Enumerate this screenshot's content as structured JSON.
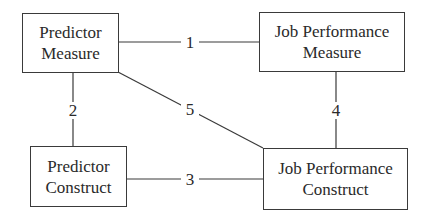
{
  "diagram": {
    "nodes": [
      {
        "id": "predictor_measure",
        "line1": "Predictor",
        "line2": "Measure"
      },
      {
        "id": "job_performance_measure",
        "line1": "Job Performance",
        "line2": "Measure"
      },
      {
        "id": "predictor_construct",
        "line1": "Predictor",
        "line2": "Construct"
      },
      {
        "id": "job_performance_construct",
        "line1": "Job Performance",
        "line2": "Construct"
      }
    ],
    "edges": [
      {
        "label": "1",
        "from": "predictor_measure",
        "to": "job_performance_measure"
      },
      {
        "label": "2",
        "from": "predictor_measure",
        "to": "predictor_construct"
      },
      {
        "label": "3",
        "from": "predictor_construct",
        "to": "job_performance_construct"
      },
      {
        "label": "4",
        "from": "job_performance_measure",
        "to": "job_performance_construct"
      },
      {
        "label": "5",
        "from": "predictor_measure",
        "to": "job_performance_construct"
      }
    ],
    "colors": {
      "line": "#3a3a3a",
      "text": "#2a2a2a",
      "background": "#ffffff"
    }
  }
}
